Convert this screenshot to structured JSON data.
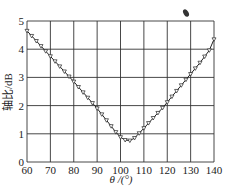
{
  "chart_data": {
    "type": "line",
    "title": "",
    "xlabel": "θ /(°)",
    "ylabel": "轴比/dB",
    "xlim": [
      60,
      140
    ],
    "ylim": [
      0,
      5
    ],
    "xticks": [
      60,
      70,
      80,
      90,
      100,
      110,
      120,
      130,
      140
    ],
    "yticks": [
      0,
      1,
      2,
      3,
      4,
      5
    ],
    "grid": true,
    "marker": "triangle-down-open",
    "series": [
      {
        "name": "axial ratio",
        "x": [
          60,
          62,
          64,
          66,
          68,
          70,
          72,
          74,
          76,
          78,
          80,
          82,
          84,
          86,
          88,
          90,
          92,
          94,
          96,
          98,
          100,
          102,
          104,
          106,
          108,
          110,
          112,
          114,
          116,
          118,
          120,
          122,
          124,
          126,
          128,
          130,
          132,
          134,
          136,
          138,
          140
        ],
        "values": [
          4.65,
          4.47,
          4.29,
          4.11,
          3.93,
          3.75,
          3.57,
          3.39,
          3.21,
          3.03,
          2.85,
          2.66,
          2.47,
          2.28,
          2.09,
          1.9,
          1.69,
          1.48,
          1.27,
          1.06,
          0.88,
          0.78,
          0.76,
          0.85,
          1.02,
          1.2,
          1.38,
          1.56,
          1.74,
          1.92,
          2.12,
          2.32,
          2.52,
          2.72,
          2.92,
          3.12,
          3.32,
          3.52,
          3.74,
          3.96,
          4.35
        ]
      }
    ]
  }
}
